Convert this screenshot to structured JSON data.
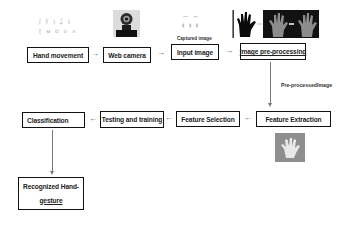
{
  "diagram": {
    "nodes": {
      "hand_movement": "Hand movement",
      "web_camera": "Web camera",
      "input_image": "Input image",
      "image_preprocessing": "Image pre-processing",
      "feature_extraction": "Feature Extraction",
      "feature_selection": "Feature Selection",
      "testing_training": "Testing and training",
      "classification": "Classification",
      "recognized_line1": "Recognized Hand-",
      "recognized_line2": "gesture"
    },
    "labels": {
      "captured_image": "Captured image",
      "preprocessed_image": "Pre-processedImage"
    },
    "arrows": {
      "right": "→",
      "left": "←"
    },
    "images": {
      "hand_signs_row1": "ʃ ʄ ʅ ʆ ʇ",
      "hand_signs_row2": "ʈ ʉ ʊ ʋ ʌ",
      "captured_figures_row1": "⌒ ⌒",
      "captured_figures_row2": "ǂ ǂ ǂ"
    },
    "edges": [
      [
        "Hand movement",
        "Web camera"
      ],
      [
        "Web camera",
        "Input image"
      ],
      [
        "Input image",
        "Image pre-processing"
      ],
      [
        "Image pre-processing",
        "Feature Extraction"
      ],
      [
        "Feature Extraction",
        "Feature Selection"
      ],
      [
        "Feature Selection",
        "Testing and training"
      ],
      [
        "Testing and training",
        "Classification"
      ],
      [
        "Classification",
        "Recognized Hand-gesture"
      ]
    ]
  }
}
